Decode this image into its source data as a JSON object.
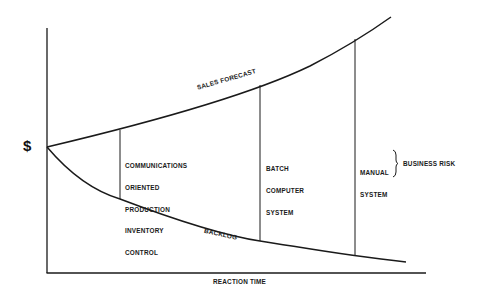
{
  "diagram": {
    "y_axis_label": "$",
    "x_axis_label": "REACTION TIME",
    "curves": {
      "upper": "SALES FORECAST",
      "lower": "BACKLOG"
    },
    "regions": [
      {
        "label_lines": [
          "COMMUNICATIONS",
          "ORIENTED",
          "PRODUCTION",
          "INVENTORY",
          "CONTROL"
        ]
      },
      {
        "label_lines": [
          "BATCH",
          "COMPUTER",
          "SYSTEM"
        ]
      },
      {
        "label_lines": [
          "MANUAL",
          "SYSTEM"
        ]
      }
    ],
    "bracket_label": "BUSINESS RISK",
    "colors": {
      "ink": "#1a1a1a",
      "background": "#ffffff"
    }
  }
}
